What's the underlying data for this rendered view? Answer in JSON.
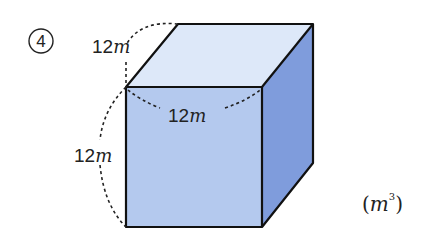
{
  "problem": {
    "number_label": "4",
    "answer_unit_open": "(",
    "answer_unit": "m",
    "answer_unit_exp": "3",
    "answer_unit_close": ")"
  },
  "shape": {
    "type": "cube",
    "colors": {
      "front": "#b4c9ee",
      "top": "#dde8f9",
      "side": "#7f9cdc",
      "edge": "#111111"
    }
  },
  "dimensions": {
    "depth": {
      "value": "12",
      "unit": "m"
    },
    "width": {
      "value": "12",
      "unit": "m"
    },
    "height": {
      "value": "12",
      "unit": "m"
    }
  }
}
